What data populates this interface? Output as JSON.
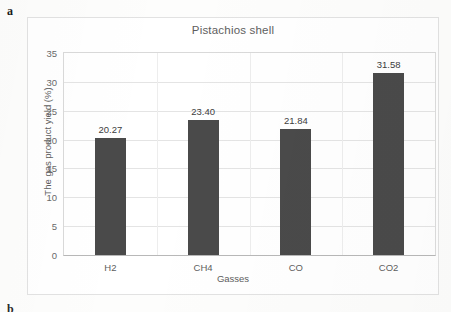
{
  "panel": {
    "letter_a": "a",
    "letter_b": "b"
  },
  "chart_data": {
    "type": "bar",
    "title": "Pistachios shell",
    "xlabel": "Gasses",
    "ylabel": "The gas product yield (%)",
    "categories": [
      "H2",
      "CH4",
      "CO",
      "CO2"
    ],
    "values": [
      20.27,
      23.4,
      21.84,
      31.58
    ],
    "value_labels": [
      "20.27",
      "23.40",
      "21.84",
      "31.58"
    ],
    "ylim": [
      0,
      35
    ],
    "ytick_step": 5,
    "yticks": [
      35,
      30,
      25,
      20,
      15,
      10,
      5,
      0
    ],
    "ytick_labels": [
      "35",
      "30",
      "25",
      "20",
      "15",
      "10",
      "5",
      "0"
    ],
    "grid": "horizontal",
    "legend": "none",
    "series_color": "#4a4a4a",
    "plot_background": "#ffffff",
    "frame_border_color": "#e2e2e2"
  }
}
